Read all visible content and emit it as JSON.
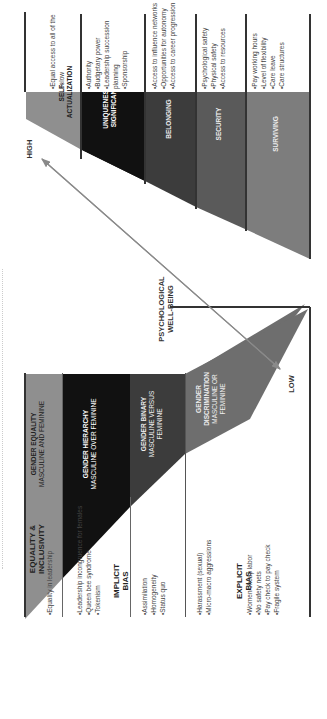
{
  "left_diagram": {
    "rows": [
      {
        "label": "EQUALITY & INCLUSIVITY",
        "bullets": [
          "Equality in leadership"
        ],
        "band_label": "GENDER EQUALITY",
        "band_sub": "MASCULINE AND FEMININE",
        "color": "#8f8f8f"
      },
      {
        "label": "IMPLICIT BIAS",
        "bullets_groups": [
          [
            "Leadership incongruence for females",
            "Queen bee syndrome",
            "Tokenism"
          ],
          [
            "Assimilation",
            "Homogeneity",
            "Status quo"
          ]
        ],
        "bands": [
          {
            "band_label": "GENDER HIERARCHY",
            "band_sub": "MASCULINE OVER FEMININE",
            "color": "#111111"
          },
          {
            "band_label": "GENDER BINARY",
            "band_sub": "MASCULINE VERSUS FEMININE",
            "color": "#3c3c3c"
          }
        ]
      },
      {
        "label": "EXPLICIT BIAS",
        "bullets_groups": [
          [
            "Harassment (sexual)",
            "Micro-macro aggressions"
          ],
          [
            "Women cheap labor",
            "No safety nets",
            "Pay check to pay check",
            "Fragile system"
          ]
        ],
        "band_label": "GENDER DISCRIMINATION",
        "band_sub": "MASCULINE OR FEMININE",
        "color": "#6e6e6e"
      }
    ]
  },
  "right_diagram": {
    "levels": [
      {
        "label": "SELF-ACTUALIZATION",
        "bullets": [
          "Equal access to all of the below"
        ],
        "color": "#8f8f8f"
      },
      {
        "label": "UNIQUENESS & SIGNIFICANCE",
        "bullets": [
          "Authority",
          "Budgetary power",
          "Leadership succession planning",
          "Sponsorship"
        ],
        "color": "#111111"
      },
      {
        "label": "BELONGING",
        "bullets": [
          "Access to influence networks",
          "Opportunities for autonomy",
          "Access to career progression"
        ],
        "color": "#3c3c3c"
      },
      {
        "label": "SECURITY",
        "bullets": [
          "Psychological safety",
          "Physical safety",
          "Access to resources"
        ],
        "color": "#5a5a5a"
      },
      {
        "label": "SURVIVING",
        "bullets": [
          "Pay working hours",
          "Level of flexibility",
          "Care leave",
          "Care structures"
        ],
        "color": "#7d7d7d"
      }
    ]
  },
  "axis": {
    "high": "HIGH",
    "low": "LOW",
    "title_line1": "PSYCHOLOGICAL",
    "title_line2": "WELL-BEING",
    "arrow_color": "#8a8a8a"
  }
}
